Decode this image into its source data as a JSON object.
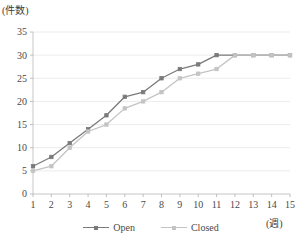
{
  "chart_data": {
    "type": "line",
    "title": "",
    "subtitle": "",
    "xlabel": "(週)",
    "ylabel": "(件数)",
    "x": [
      1,
      2,
      3,
      4,
      5,
      6,
      7,
      8,
      9,
      10,
      11,
      12,
      13,
      14,
      15
    ],
    "xtick_labels": [
      "1",
      "2",
      "3",
      "4",
      "5",
      "6",
      "7",
      "8",
      "9",
      "10",
      "11",
      "12",
      "13",
      "14",
      "15"
    ],
    "ytick_labels": [
      "0",
      "5",
      "10",
      "15",
      "20",
      "25",
      "30",
      "35"
    ],
    "yticks": [
      0,
      5,
      10,
      15,
      20,
      25,
      30,
      35
    ],
    "ylim": [
      0,
      35
    ],
    "xlim": [
      1,
      15
    ],
    "grid": true,
    "grid_axis": "y",
    "legend_position": "bottom-center",
    "series": [
      {
        "name": "Open",
        "color": "#7a7a7a",
        "marker": "square",
        "values": [
          6,
          8,
          11,
          14,
          17,
          21,
          22,
          25,
          27,
          28,
          30,
          30,
          30,
          30,
          30
        ]
      },
      {
        "name": "Closed",
        "color": "#c4c4c4",
        "marker": "square",
        "values": [
          5,
          6,
          10,
          13.5,
          15,
          18.5,
          20,
          22,
          25,
          26,
          27,
          30,
          30,
          30,
          30
        ]
      }
    ]
  },
  "legend": {
    "items": [
      {
        "label": "Open"
      },
      {
        "label": "Closed"
      }
    ]
  },
  "axes": {
    "y_axis_caption": "(件数)",
    "x_axis_caption": "(週)"
  },
  "colors": {
    "open": "#7a7a7a",
    "closed": "#c4c4c4",
    "grid": "#e2e2e2",
    "axis": "#b8b8b8",
    "text": "#4a4a4a",
    "background": "#ffffff"
  }
}
